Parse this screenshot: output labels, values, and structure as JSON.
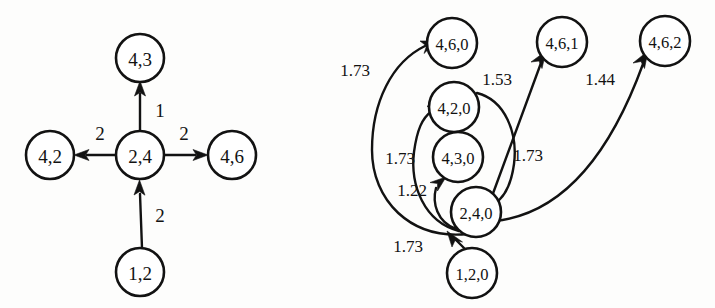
{
  "figure": {
    "background_color": "#fdfdfc",
    "ink_color": "#121212"
  },
  "left_graph": {
    "name": "unlabeled-weighted-graph",
    "nodes": [
      {
        "id": "n-4-3",
        "label": "4,3",
        "cx": 140,
        "cy": 58,
        "r": 24
      },
      {
        "id": "n-4-2",
        "label": "4,2",
        "cx": 50,
        "cy": 155,
        "r": 24
      },
      {
        "id": "n-2-4",
        "label": "2,4",
        "cx": 140,
        "cy": 155,
        "r": 24
      },
      {
        "id": "n-4-6",
        "label": "4,6",
        "cx": 232,
        "cy": 155,
        "r": 24
      },
      {
        "id": "n-1-2",
        "label": "1,2",
        "cx": 140,
        "cy": 272,
        "r": 24
      }
    ],
    "edges": [
      {
        "id": "e-24-43",
        "from": "2,4",
        "to": "4,3",
        "weight": "1",
        "lx": 160,
        "ly": 110
      },
      {
        "id": "e-24-42",
        "from": "2,4",
        "to": "4,2",
        "weight": "2",
        "lx": 100,
        "ly": 133
      },
      {
        "id": "e-24-46",
        "from": "2,4",
        "to": "4,6",
        "weight": "2",
        "lx": 184,
        "ly": 133
      },
      {
        "id": "e-12-24",
        "from": "1,2",
        "to": "2,4",
        "weight": "2",
        "lx": 160,
        "ly": 215
      }
    ]
  },
  "right_graph": {
    "name": "expanded-weighted-graph",
    "nodes": [
      {
        "id": "r-4-6-0",
        "label": "4,6,0",
        "cx": 452,
        "cy": 43,
        "r": 25
      },
      {
        "id": "r-4-6-1",
        "label": "4,6,1",
        "cx": 562,
        "cy": 42,
        "r": 25
      },
      {
        "id": "r-4-6-2",
        "label": "4,6,2",
        "cx": 665,
        "cy": 41,
        "r": 25
      },
      {
        "id": "r-4-2-0",
        "label": "4,2,0",
        "cx": 454,
        "cy": 107,
        "r": 25
      },
      {
        "id": "r-4-3-0",
        "label": "4,3,0",
        "cx": 458,
        "cy": 157,
        "r": 25
      },
      {
        "id": "r-2-4-0",
        "label": "2,4,0",
        "cx": 476,
        "cy": 212,
        "r": 25
      },
      {
        "id": "r-1-2-0",
        "label": "1,2,0",
        "cx": 472,
        "cy": 273,
        "r": 25
      }
    ],
    "edges": [
      {
        "id": "re-240-460",
        "from": "2,4,0",
        "to": "4,6,0",
        "weight": "1.73",
        "lx": 355,
        "ly": 70
      },
      {
        "id": "re-240-420",
        "from": "2,4,0",
        "to": "4,2,0",
        "weight": "1.73",
        "lx": 400,
        "ly": 158
      },
      {
        "id": "re-240-430",
        "from": "2,4,0",
        "to": "4,3,0",
        "weight": "1.22",
        "lx": 412,
        "ly": 190
      },
      {
        "id": "re-420-240",
        "from": "4,2,0",
        "to": "2,4,0",
        "weight": "1.73",
        "lx": 528,
        "ly": 155
      },
      {
        "id": "re-240-461",
        "from": "2,4,0",
        "to": "4,6,1",
        "weight": "1.53",
        "lx": 497,
        "ly": 79
      },
      {
        "id": "re-240-462",
        "from": "2,4,0",
        "to": "4,6,2",
        "weight": "1.44",
        "lx": 600,
        "ly": 79
      },
      {
        "id": "re-120-240",
        "from": "1,2,0",
        "to": "2,4,0",
        "weight": "1.73",
        "lx": 408,
        "ly": 246
      }
    ]
  }
}
